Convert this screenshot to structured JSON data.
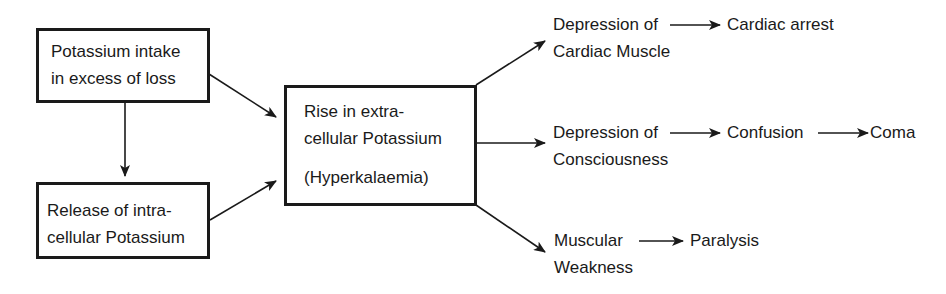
{
  "diagram": {
    "type": "flowchart",
    "nodes": {
      "intake": {
        "lines": [
          "Potassium intake",
          "in excess of loss"
        ]
      },
      "release": {
        "lines": [
          "Release of intra-",
          "cellular Potassium"
        ]
      },
      "rise": {
        "lines": [
          "Rise in extra-",
          "cellular Potassium",
          "(Hyperkalaemia)"
        ]
      },
      "cardiac": {
        "lines": [
          "Depression of",
          "Cardiac Muscle"
        ]
      },
      "cardiac_arrest": {
        "label": "Cardiac arrest"
      },
      "conscious": {
        "lines": [
          "Depression of",
          "Consciousness"
        ]
      },
      "confusion": {
        "label": "Confusion"
      },
      "coma": {
        "label": "Coma"
      },
      "muscular": {
        "lines": [
          "Muscular",
          "Weakness"
        ]
      },
      "paralysis": {
        "label": "Paralysis"
      }
    },
    "edges": [
      [
        "intake",
        "release"
      ],
      [
        "intake",
        "rise"
      ],
      [
        "release",
        "rise"
      ],
      [
        "rise",
        "cardiac"
      ],
      [
        "rise",
        "conscious"
      ],
      [
        "rise",
        "muscular"
      ],
      [
        "cardiac",
        "cardiac_arrest"
      ],
      [
        "conscious",
        "confusion"
      ],
      [
        "confusion",
        "coma"
      ],
      [
        "muscular",
        "paralysis"
      ]
    ],
    "colors": {
      "ink": "#1a1a1a",
      "background": "#ffffff"
    }
  }
}
